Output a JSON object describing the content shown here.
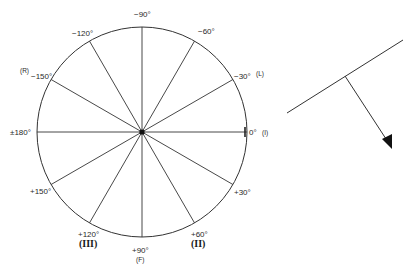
{
  "diagram": {
    "type": "polar-angle-wheel",
    "center": [
      142,
      132
    ],
    "radius": 105,
    "spokes_deg": [
      0,
      30,
      60,
      90,
      120,
      150,
      180,
      -30,
      -60,
      -90,
      -120,
      -150
    ],
    "labels": {
      "m90": "−90°",
      "m60": "−60°",
      "m30": "−30°",
      "m120": "−120°",
      "m150": "−150°",
      "p180": "±180°",
      "p0": "0°",
      "p30": "+30°",
      "p60": "+60°",
      "p90": "+90°",
      "p120": "+120°",
      "p150": "+150°"
    },
    "tags": {
      "R": "(R)",
      "L": "(L)",
      "I": "(I)",
      "F": "(F)",
      "II": "(II)",
      "III": "(III)"
    }
  },
  "vector_figure": {
    "baseline": {
      "from": [
        287,
        113
      ],
      "to": [
        403,
        40
      ]
    },
    "normal_arrow": {
      "from": [
        345,
        76
      ],
      "to": [
        392,
        149
      ]
    }
  },
  "colors": {
    "stroke": "#333333",
    "background": "#ffffff"
  }
}
